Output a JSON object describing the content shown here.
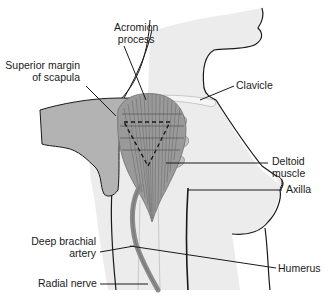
{
  "figure": {
    "type": "anatomical-illustration",
    "colors": {
      "background": "#ffffff",
      "skin": "#ececec",
      "hand": "#b3b3b3",
      "muscle": "#9a9a9a",
      "artery": "#8a8a8a",
      "outline": "#1a1a1a"
    }
  },
  "labels": {
    "acromion_process": {
      "line1": "Acromion",
      "line2": "process"
    },
    "superior_margin": {
      "line1": "Superior margin",
      "line2": "of scapula"
    },
    "clavicle": "Clavicle",
    "deltoid_muscle": {
      "line1": "Deltoid",
      "line2": "muscle"
    },
    "axilla": "Axilla",
    "deep_brachial_artery": {
      "line1": "Deep brachial",
      "line2": "artery"
    },
    "humerus": "Humerus",
    "radial_nerve": "Radial nerve"
  }
}
